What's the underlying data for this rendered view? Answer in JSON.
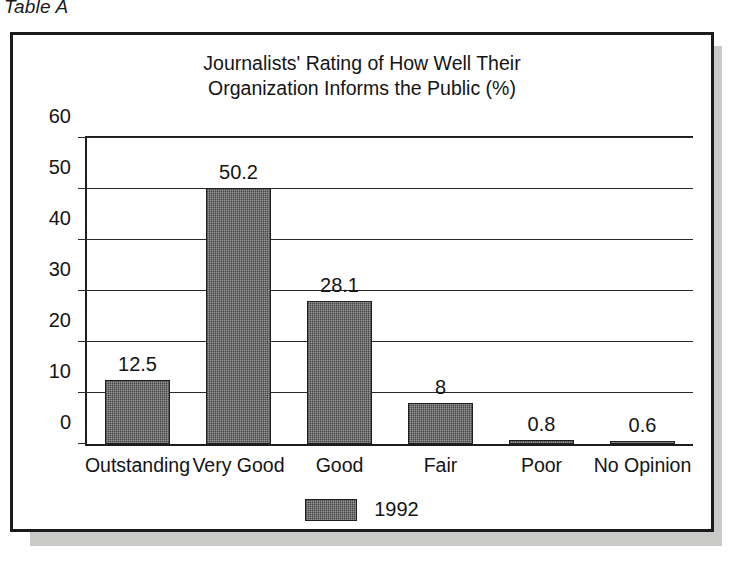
{
  "figure": {
    "caption": "Table A"
  },
  "chart_data": {
    "type": "bar",
    "title": "Journalists' Rating of How Well Their Organization Informs the Public (%)",
    "title_lines": [
      "Journalists' Rating of How Well Their",
      "Organization Informs the Public (%)"
    ],
    "categories": [
      "Outstanding",
      "Very Good",
      "Good",
      "Fair",
      "Poor",
      "No Opinion"
    ],
    "values": [
      12.5,
      50.2,
      28.1,
      8,
      0.8,
      0.6
    ],
    "value_labels": [
      "12.5",
      "50.2",
      "28.1",
      "8",
      "0.8",
      "0.6"
    ],
    "series": [
      {
        "name": "1992",
        "values": [
          12.5,
          50.2,
          28.1,
          8,
          0.8,
          0.6
        ]
      }
    ],
    "xlabel": "",
    "ylabel": "",
    "ylim": [
      0,
      60
    ],
    "yticks": [
      0,
      10,
      20,
      30,
      40,
      50,
      60
    ],
    "ytick_labels": [
      "0",
      "10",
      "20",
      "30",
      "40",
      "50",
      "60"
    ],
    "grid": true,
    "legend": {
      "position": "bottom-center",
      "entries": [
        {
          "label": "1992",
          "color": "#5e5e5e"
        }
      ]
    },
    "colors": {
      "bar_fill": "#5e5e5e",
      "bar_edge": "#1f1f1f",
      "axis": "#1d1d1d",
      "grid": "#2a2a2a",
      "text": "#141414",
      "frame": "#1b1b1b",
      "shadow": "#c9c9c7",
      "background": "#ffffff"
    }
  }
}
